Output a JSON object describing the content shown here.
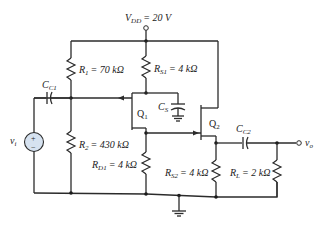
{
  "circuit": {
    "supply": {
      "symbol": "V",
      "sub": "DD",
      "value": "= 20 V"
    },
    "resistors": {
      "R1": {
        "symbol": "R",
        "sub": "1",
        "value": "= 70 kΩ"
      },
      "R2": {
        "symbol": "R",
        "sub": "2",
        "value": "= 430 kΩ"
      },
      "RS1": {
        "symbol": "R",
        "sub": "S1",
        "value": "= 4 kΩ"
      },
      "RD1": {
        "symbol": "R",
        "sub": "D1",
        "value": "= 4 kΩ"
      },
      "RS2": {
        "symbol": "R",
        "sub": "S2",
        "value": "= 4 kΩ"
      },
      "RL": {
        "symbol": "R",
        "sub": "L",
        "value": "= 2 kΩ"
      }
    },
    "capacitors": {
      "CC1": {
        "symbol": "C",
        "sub": "C1"
      },
      "CS": {
        "symbol": "C",
        "sub": "S"
      },
      "CC2": {
        "symbol": "C",
        "sub": "C2"
      }
    },
    "transistors": {
      "Q1": {
        "label": "Q",
        "sub": "1"
      },
      "Q2": {
        "label": "Q",
        "sub": "2"
      }
    },
    "source": {
      "symbol": "v",
      "sub": "i",
      "plus": "+",
      "minus": "−"
    },
    "output": {
      "symbol": "v",
      "sub": "o"
    },
    "colors": {
      "source_fill": "#d6e2f0",
      "wire": "#2b2b2b"
    }
  }
}
